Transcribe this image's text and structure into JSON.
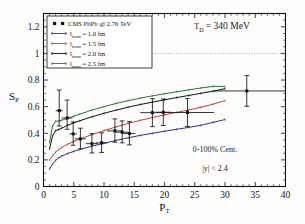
{
  "figure": {
    "title": "",
    "background": "#fdfdfb"
  },
  "chart_data": {
    "type": "line",
    "title": "",
    "xlabel": "P_T",
    "ylabel": "S_P",
    "xlim": [
      0,
      40
    ],
    "ylim": [
      0,
      1.3
    ],
    "grid": false,
    "legend_position": "top-left",
    "x_ticks": [
      0,
      5,
      10,
      15,
      20,
      25,
      30,
      35,
      40
    ],
    "x_tick_labels": [
      "0",
      "5",
      "10",
      "15",
      "20",
      "25",
      "30",
      "35",
      "40"
    ],
    "y_ticks": [
      0,
      0.2,
      0.4,
      0.6,
      0.8,
      1,
      1.2
    ],
    "y_tick_labels": [
      "0",
      "0.2",
      "0.4",
      "0.6",
      "0.8",
      "1",
      "1.2"
    ],
    "reference_lines": [
      {
        "name": "unity-line",
        "orientation": "horizontal",
        "value": 1,
        "style": "dotted",
        "color": "#8a8a8a"
      }
    ],
    "series": [
      {
        "name": "CMS PbPb @ 2.76 TeV",
        "type": "scatter",
        "color": "#141414",
        "marker": "square",
        "points": [
          {
            "x": 2.6,
            "y": 0.57,
            "yerr_lo": 0.115,
            "yerr_hi": 0.155,
            "xerr_lo": 0.6,
            "xerr_hi": 0.6
          },
          {
            "x": 3.9,
            "y": 0.515,
            "yerr_lo": 0.085,
            "yerr_hi": 0.135,
            "xerr_lo": 0.9,
            "xerr_hi": 0.9
          },
          {
            "x": 4.9,
            "y": 0.395,
            "yerr_lo": 0.085,
            "yerr_hi": 0.09,
            "xerr_lo": 0.6,
            "xerr_hi": 0.6
          },
          {
            "x": 6.1,
            "y": 0.358,
            "yerr_lo": 0.075,
            "yerr_hi": 0.08,
            "xerr_lo": 0.9,
            "xerr_hi": 0.9
          },
          {
            "x": 8.0,
            "y": 0.322,
            "yerr_lo": 0.07,
            "yerr_hi": 0.075,
            "xerr_lo": 1.0,
            "xerr_hi": 1.0
          },
          {
            "x": 9.6,
            "y": 0.328,
            "yerr_lo": 0.072,
            "yerr_hi": 0.075,
            "xerr_lo": 1.0,
            "xerr_hi": 1.0
          },
          {
            "x": 11.8,
            "y": 0.418,
            "yerr_lo": 0.085,
            "yerr_hi": 0.09,
            "xerr_lo": 1.3,
            "xerr_hi": 1.3
          },
          {
            "x": 13.0,
            "y": 0.408,
            "yerr_lo": 0.08,
            "yerr_hi": 0.085,
            "xerr_lo": 1.0,
            "xerr_hi": 1.0
          },
          {
            "x": 14.2,
            "y": 0.398,
            "yerr_lo": 0.085,
            "yerr_hi": 0.09,
            "xerr_lo": 1.0,
            "xerr_hi": 1.0
          },
          {
            "x": 18.0,
            "y": 0.555,
            "yerr_lo": 0.105,
            "yerr_hi": 0.105,
            "xerr_lo": 2.0,
            "xerr_hi": 2.0
          },
          {
            "x": 19.8,
            "y": 0.558,
            "yerr_lo": 0.1,
            "yerr_hi": 0.1,
            "xerr_lo": 1.3,
            "xerr_hi": 1.3
          },
          {
            "x": 23.8,
            "y": 0.556,
            "yerr_lo": 0.105,
            "yerr_hi": 0.105,
            "xerr_lo": 4.4,
            "xerr_hi": 4.4
          },
          {
            "x": 33.6,
            "y": 0.718,
            "yerr_lo": 0.115,
            "yerr_hi": 0.115,
            "xerr_lo": 5.6,
            "xerr_hi": 6.4
          }
        ]
      },
      {
        "name": "l_form = 1.0 fm",
        "label_value": "1.0 fm",
        "color": "#3a2b8c",
        "x": [
          1.0,
          1.5,
          2.0,
          2.5,
          3.0,
          4.0,
          5.0,
          6.0,
          8.0,
          10.0,
          12.0,
          14.0,
          16.0,
          18.0,
          20.0,
          22.0,
          24.0,
          26.0,
          28.0,
          30.0
        ],
        "y": [
          0.132,
          0.168,
          0.196,
          0.215,
          0.228,
          0.248,
          0.264,
          0.278,
          0.303,
          0.325,
          0.346,
          0.366,
          0.384,
          0.4,
          0.415,
          0.43,
          0.444,
          0.46,
          0.482,
          0.503
        ]
      },
      {
        "name": "l_form = 1.5 fm",
        "label_value": "1.5 fm",
        "color": "#d03a34",
        "x": [
          1.0,
          1.5,
          2.0,
          2.5,
          3.0,
          4.0,
          5.0,
          6.0,
          8.0,
          10.0,
          12.0,
          14.0,
          16.0,
          18.0,
          20.0,
          22.0,
          24.0,
          26.0,
          28.0,
          30.0
        ],
        "y": [
          0.2,
          0.232,
          0.258,
          0.277,
          0.292,
          0.318,
          0.338,
          0.356,
          0.39,
          0.42,
          0.448,
          0.474,
          0.497,
          0.518,
          0.538,
          0.557,
          0.575,
          0.595,
          0.618,
          0.645
        ]
      },
      {
        "name": "l_form = 2.0 fm",
        "label_value": "2.0 fm",
        "color": "#111111",
        "x": [
          1.0,
          1.5,
          2.0,
          2.5,
          3.0,
          4.0,
          5.0,
          6.0,
          8.0,
          10.0,
          12.0,
          14.0,
          16.0,
          18.0,
          20.0,
          22.0,
          24.0,
          26.0,
          28.0,
          30.0
        ],
        "y": [
          0.282,
          0.38,
          0.42,
          0.428,
          0.438,
          0.46,
          0.478,
          0.494,
          0.524,
          0.55,
          0.574,
          0.596,
          0.616,
          0.634,
          0.651,
          0.668,
          0.684,
          0.7,
          0.716,
          0.735
        ]
      },
      {
        "name": "l_form = 2.5 fm",
        "label_value": "2.5 fm",
        "color": "#1f7a2e",
        "x": [
          1.0,
          1.5,
          2.0,
          2.5,
          3.0,
          4.0,
          5.0,
          6.0,
          8.0,
          10.0,
          12.0,
          14.0,
          16.0,
          18.0,
          20.0,
          22.0,
          24.0,
          26.0,
          28.0,
          30.0
        ],
        "y": [
          0.33,
          0.455,
          0.49,
          0.492,
          0.498,
          0.512,
          0.528,
          0.544,
          0.574,
          0.6,
          0.624,
          0.645,
          0.664,
          0.681,
          0.697,
          0.712,
          0.726,
          0.74,
          0.752,
          0.752
        ]
      }
    ]
  },
  "legend": {
    "entries": [
      {
        "label": "CMS PbPb @ 2.76 TeV",
        "marker": "square",
        "color": "#141414"
      },
      {
        "symbol": "l",
        "sub": "form",
        "eq": "= 1.0 fm",
        "color": "#3a2b8c"
      },
      {
        "symbol": "l",
        "sub": "form",
        "eq": "= 1.5 fm",
        "color": "#d03a34"
      },
      {
        "symbol": "l",
        "sub": "form",
        "eq": "= 2.0 fm",
        "color": "#111111"
      },
      {
        "symbol": "l",
        "sub": "form",
        "eq": "= 2.5 fm",
        "color": "#1f7a2e"
      }
    ]
  },
  "annotations": {
    "temperature": {
      "symbol": "T",
      "sub": "D",
      "text": "= 340 MeV"
    },
    "centrality": "0-100% Cent.",
    "rapidity": "|y| < 2.4"
  },
  "axes": {
    "y_title": {
      "symbol": "S",
      "sub": "P"
    },
    "x_title": {
      "symbol": "P",
      "sub": "T"
    }
  }
}
